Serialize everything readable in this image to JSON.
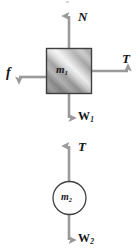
{
  "diagram": {
    "type": "free-body-diagram",
    "background_color": "#ffffff",
    "stroke_color": "#9a9a9a",
    "outline_color": "#3c3c3c",
    "text_color": "#141414",
    "bodies": [
      {
        "name": "block",
        "shape": "square",
        "label": "m",
        "subscript": "1",
        "fill": "metallic-gradient",
        "x": 46,
        "y": 48,
        "width": 46,
        "height": 46
      },
      {
        "name": "hanging-mass",
        "shape": "circle",
        "label": "m",
        "subscript": "2",
        "fill": "#fdfdfd",
        "cx": 70,
        "cy": 198,
        "r": 17
      }
    ],
    "forces": [
      {
        "name": "normal-force",
        "label": "N",
        "subscript": "",
        "direction": "up",
        "body": "block"
      },
      {
        "name": "tension-block",
        "label": "T",
        "subscript": "",
        "direction": "right",
        "body": "block"
      },
      {
        "name": "friction-force",
        "label": "f",
        "subscript": "",
        "direction": "left",
        "body": "block"
      },
      {
        "name": "weight-block",
        "label": "W",
        "subscript": "1",
        "direction": "down",
        "body": "block"
      },
      {
        "name": "tension-mass2",
        "label": "T",
        "subscript": "",
        "direction": "up",
        "body": "hanging-mass"
      },
      {
        "name": "weight-mass2",
        "label": "W",
        "subscript": "2",
        "direction": "down",
        "body": "hanging-mass"
      }
    ]
  }
}
